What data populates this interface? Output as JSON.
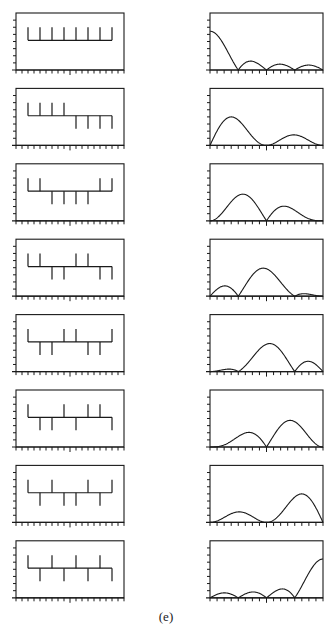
{
  "figure": {
    "caption": "(e)",
    "line_color": "#1a1a1a",
    "background": "#ffffff"
  },
  "layout": {
    "left_frame": {
      "x0": 16,
      "x1": 124
    },
    "right_frame": {
      "x0": 210,
      "x1": 323
    },
    "first_top": 13,
    "frame_height": 57,
    "pitch": 75.4,
    "y_ticks": 8,
    "x_ticks_left": 18,
    "x_ticks_right": 16
  },
  "chart_data": [
    {
      "type": "diagram",
      "title": "Walsh sequences (time domain, left column)",
      "description": "Eight length-8 +/-1 sequences drawn as stems from a baseline",
      "sequences": [
        [
          1,
          1,
          1,
          1,
          1,
          1,
          1,
          1
        ],
        [
          1,
          1,
          1,
          1,
          -1,
          -1,
          -1,
          -1
        ],
        [
          1,
          1,
          -1,
          -1,
          -1,
          -1,
          1,
          1
        ],
        [
          1,
          1,
          -1,
          -1,
          1,
          1,
          -1,
          -1
        ],
        [
          1,
          -1,
          -1,
          1,
          1,
          -1,
          -1,
          1
        ],
        [
          1,
          -1,
          -1,
          1,
          -1,
          1,
          1,
          -1
        ],
        [
          1,
          -1,
          1,
          -1,
          -1,
          1,
          -1,
          1
        ],
        [
          1,
          -1,
          1,
          -1,
          1,
          -1,
          1,
          -1
        ]
      ]
    },
    {
      "type": "line",
      "title": "Magnitude spectra (right column)",
      "description": "Magnitude of the DFT of each sequence, normalized frequency 0..1 across the panel; lobe shapes as read from plot",
      "ylim": [
        0,
        1
      ],
      "series": [
        {
          "name": "spectrum-1",
          "peak_x": 0.0,
          "peak_y": 0.67,
          "nulls": [
            0.25,
            0.5,
            0.75
          ]
        },
        {
          "name": "spectrum-2",
          "peak_x": 0.17,
          "peak_y": 0.53,
          "secondary_peak_x": 0.72,
          "secondary_peak_y": 0.2
        },
        {
          "name": "spectrum-3",
          "peak_x": 0.29,
          "peak_y": 0.45,
          "secondary_peak_x": 0.66,
          "secondary_peak_y": 0.3
        },
        {
          "name": "spectrum-4",
          "peak_x": 0.47,
          "peak_y": 0.5,
          "secondary_peak_x": 0.13,
          "secondary_peak_y": 0.18
        },
        {
          "name": "spectrum-5",
          "peak_x": 0.53,
          "peak_y": 0.5,
          "secondary_peak_x": 0.87,
          "secondary_peak_y": 0.3
        },
        {
          "name": "spectrum-6",
          "peak_x": 0.73,
          "peak_y": 0.45,
          "secondary_peak_x": 0.34,
          "secondary_peak_y": 0.3
        },
        {
          "name": "spectrum-7",
          "peak_x": 0.83,
          "peak_y": 0.53,
          "secondary_peak_x": 0.27,
          "secondary_peak_y": 0.2
        },
        {
          "name": "spectrum-8",
          "peak_x": 1.0,
          "peak_y": 0.67,
          "nulls": [
            0.25,
            0.5,
            0.75
          ]
        }
      ]
    }
  ]
}
